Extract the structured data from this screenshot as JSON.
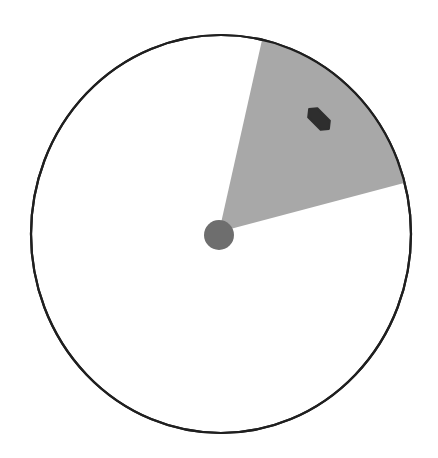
{
  "scene": {
    "width": 438,
    "height": 458,
    "background": "#ffffff"
  },
  "circle": {
    "cx": 221,
    "cy": 234,
    "rx": 190,
    "ry": 199,
    "stroke": "#1f1f1f",
    "stroke_width": 2.2,
    "fill": "#ffffff"
  },
  "sector": {
    "apex": [
      219,
      232
    ],
    "start_point": [
      262,
      40
    ],
    "end_point": [
      404,
      183
    ],
    "fill": "#a8a8a8",
    "description": "shaded field-of-view wedge"
  },
  "center_dot": {
    "cx": 219,
    "cy": 235,
    "r": 15,
    "fill": "#6e6e6e"
  },
  "target_object": {
    "cx": 319,
    "cy": 119,
    "length": 28,
    "width": 13,
    "rotation_deg": 45,
    "fill": "#2e2e2e"
  }
}
